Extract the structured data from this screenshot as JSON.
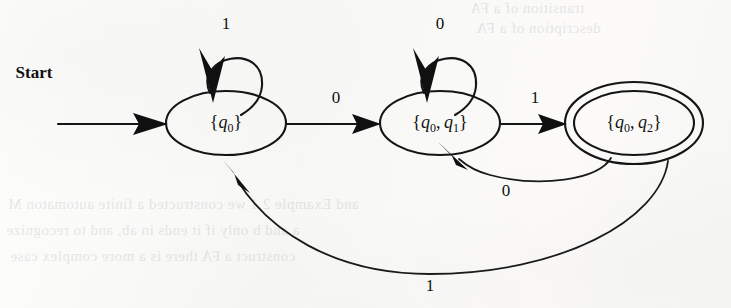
{
  "figure": {
    "kind": "finite-automaton-state-diagram",
    "start_label": "Start"
  },
  "states": [
    {
      "id": "s0",
      "label": "{q0}",
      "label_prefix": "{",
      "label_var": "q",
      "label_sub": "0",
      "label_suffix": "}",
      "accepting": false,
      "cx": 226,
      "cy": 123,
      "rx": 60,
      "ry": 32
    },
    {
      "id": "s1",
      "label": "{q0, q1}",
      "accepting": false,
      "cx": 440,
      "cy": 123,
      "rx": 60,
      "ry": 32
    },
    {
      "id": "s2",
      "label": "{q0, q2}",
      "accepting": true,
      "cx": 634,
      "cy": 123,
      "rx": 60,
      "ry": 32,
      "outer_rx": 69,
      "outer_ry": 41
    }
  ],
  "transitions": [
    {
      "id": "t-self-s0",
      "from": "s0",
      "to": "s0",
      "symbol": "1",
      "kind": "self-loop",
      "label_x": 226,
      "label_y": 25
    },
    {
      "id": "t-s0-s1",
      "from": "s0",
      "to": "s1",
      "symbol": "0",
      "kind": "straight",
      "label_x": 336,
      "label_y": 99
    },
    {
      "id": "t-self-s1",
      "from": "s1",
      "to": "s1",
      "symbol": "0",
      "kind": "self-loop",
      "label_x": 440,
      "label_y": 25
    },
    {
      "id": "t-s1-s2",
      "from": "s1",
      "to": "s2",
      "symbol": "1",
      "kind": "straight",
      "label_x": 535,
      "label_y": 99
    },
    {
      "id": "t-s2-s1",
      "from": "s2",
      "to": "s1",
      "symbol": "0",
      "kind": "curve-back-short",
      "label_x": 506,
      "label_y": 192
    },
    {
      "id": "t-s2-s0",
      "from": "s2",
      "to": "s0",
      "symbol": "1",
      "kind": "curve-back-long",
      "label_x": 430,
      "label_y": 287
    }
  ],
  "bleed_through_text": {
    "top_line_1": "transition of a FA",
    "top_line_2": "description of a FA",
    "bottom_line_1": "and Example 2.1 we constructed a finite automaton M",
    "bottom_line_2": "a and b only if it ends in ab, and to recognize",
    "bottom_line_3": "construct a FA there is a more complex case"
  },
  "colors": {
    "ink": "#151515",
    "paper": "#fbfbfa"
  }
}
